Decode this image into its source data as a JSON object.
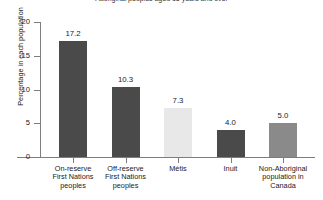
{
  "chart_data": {
    "type": "bar",
    "title": "Aboriginal peoples aged 15 years and over",
    "xlabel": "",
    "ylabel": "Percentage in each population",
    "ylim": [
      0,
      20
    ],
    "yticks": [
      0,
      5,
      10,
      15,
      20
    ],
    "ytick_labels": [
      "0",
      "5",
      "10",
      "15",
      "20"
    ],
    "grid": false,
    "legend": "none",
    "categories": [
      "On-reserve First Nations peoples",
      "Off-reserve First Nations peoples",
      "Métis",
      "Inuit",
      "Non-Aboriginal population in Canada"
    ],
    "category_lines": [
      [
        "On-reserve",
        "First Nations",
        "peoples"
      ],
      [
        "Off-reserve",
        "First Nations",
        "peoples"
      ],
      [
        "Métis"
      ],
      [
        "Inuit"
      ],
      [
        "Non-Aboriginal",
        "population in",
        "Canada"
      ]
    ],
    "values": [
      17.2,
      10.3,
      7.3,
      4.0,
      5.0
    ],
    "value_labels": [
      "17.2",
      "10.3",
      "7.3",
      "4.0",
      "5.0"
    ],
    "bar_colors": [
      "#4a4a4a",
      "#4a4a4a",
      "#e8e8e8",
      "#4a4a4a",
      "#8a8a8a"
    ]
  },
  "axis": {
    "line_color": "#7d7d7d"
  }
}
